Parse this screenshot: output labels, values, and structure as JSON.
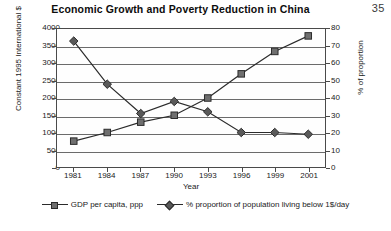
{
  "page_number": "35",
  "chart_data": {
    "type": "line",
    "title": "Economic Growth and Poverty Reduction in China",
    "xlabel": "Year",
    "categories": [
      "1981",
      "1984",
      "1987",
      "1990",
      "1993",
      "1996",
      "1999",
      "2001"
    ],
    "grid": true,
    "legend_position": "bottom",
    "axes": {
      "left": {
        "label": "Constant 1995 International $",
        "ylim": [
          0,
          4000
        ],
        "ticks": [
          "0",
          "500",
          "1000",
          "1500",
          "2000",
          "2500",
          "3000",
          "3500",
          "4000"
        ]
      },
      "right": {
        "label": "% of proportion",
        "ylim": [
          0,
          80
        ],
        "ticks": [
          "0",
          "10",
          "20",
          "30",
          "40",
          "50",
          "60",
          "70",
          "80"
        ]
      }
    },
    "series": [
      {
        "name": "GDP per capita, ppp",
        "axis": "left",
        "marker": "square",
        "color": "#6f6f6f",
        "line_color": "#2b2b2b",
        "values": [
          750,
          1000,
          1300,
          1500,
          2000,
          2700,
          3350,
          3800
        ]
      },
      {
        "name": "%  proportion of population living below 1$/day",
        "axis": "right",
        "marker": "diamond",
        "color": "#5a5a5a",
        "line_color": "#2b2b2b",
        "values": [
          73,
          48,
          31,
          38,
          32,
          20,
          20,
          19
        ]
      }
    ]
  }
}
